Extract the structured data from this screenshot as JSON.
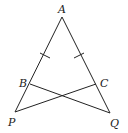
{
  "diagram": {
    "type": "geometry",
    "points": [
      {
        "name": "A",
        "x": 62,
        "y": 17,
        "label_x": 58,
        "label_y": 13
      },
      {
        "name": "B",
        "x": 30,
        "y": 84,
        "label_x": 19,
        "label_y": 87
      },
      {
        "name": "C",
        "x": 96,
        "y": 84,
        "label_x": 100,
        "label_y": 87
      },
      {
        "name": "P",
        "x": 15,
        "y": 112,
        "label_x": 8,
        "label_y": 126
      },
      {
        "name": "Q",
        "x": 110,
        "y": 113,
        "label_x": 110,
        "label_y": 127
      }
    ],
    "segments": [
      [
        "A",
        "P"
      ],
      [
        "A",
        "Q"
      ],
      [
        "B",
        "Q"
      ],
      [
        "C",
        "P"
      ]
    ],
    "congruence_marks": [
      {
        "segment": [
          "A",
          "B"
        ],
        "ticks": 1
      },
      {
        "segment": [
          "A",
          "C"
        ],
        "ticks": 1
      }
    ]
  },
  "labels": {
    "A": "A",
    "B": "B",
    "C": "C",
    "P": "P",
    "Q": "Q"
  }
}
